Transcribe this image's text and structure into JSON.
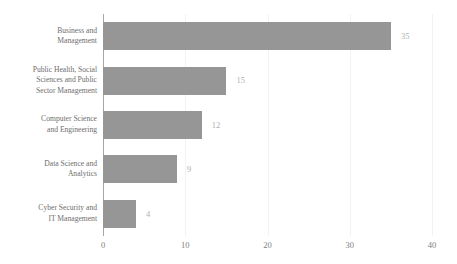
{
  "chart_data": {
    "type": "bar",
    "orientation": "horizontal",
    "title": "",
    "subtitle": "",
    "xlabel": "",
    "ylabel": "",
    "categories": [
      "Business and Management",
      "Public Health, Social Sciences and Public Sector Management",
      "Computer Science and Engineering",
      "Data Science and Analytics",
      "Cyber Security and IT Management"
    ],
    "category_lines": [
      [
        "Business and",
        "Management"
      ],
      [
        "Public Health, Social",
        "Sciences and Public",
        "Sector Management"
      ],
      [
        "Computer Science",
        "and Engineering"
      ],
      [
        "Data Science and",
        "Analytics"
      ],
      [
        "Cyber Security and",
        "IT Management"
      ]
    ],
    "values": [
      35,
      15,
      12,
      9,
      4
    ],
    "data_labels": [
      "35",
      "15",
      "12",
      "9",
      "4"
    ],
    "xlim": [
      0,
      40
    ],
    "x_ticks": [
      0,
      10,
      20,
      30,
      40
    ],
    "x_tick_labels": [
      "0",
      "10",
      "20",
      "30",
      "40"
    ],
    "grid": {
      "vertical": true,
      "horizontal": false,
      "gridline_color": "#f2f2f2",
      "axis_line_color": "#a6a6a6"
    },
    "legend": {
      "visible": false,
      "position": "none",
      "entries": []
    },
    "colors": {
      "bar": "#969696",
      "background": "#ffffff",
      "category_label": "#6e6e6e",
      "tick_label": "#808080",
      "data_label": "#b0b0b0"
    }
  }
}
